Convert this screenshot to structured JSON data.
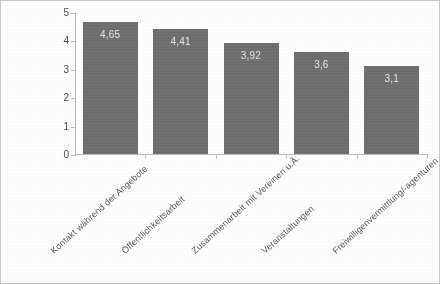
{
  "chart_data": {
    "type": "bar",
    "title": "",
    "subtitle": "",
    "xlabel": "",
    "ylabel": "",
    "ylim": [
      0,
      5
    ],
    "ytick_labels": [
      "5",
      "4",
      "3",
      "2",
      "1",
      "0"
    ],
    "ytick_values": [
      5,
      4,
      3,
      2,
      1,
      0
    ],
    "grid": false,
    "legend": false,
    "legend_position": "none",
    "bar_color": "#6d6d6d",
    "value_label_color": "#e9e9e9",
    "axis_color": "#b9b9b9",
    "categories": [
      "Kontakt während der Angebote",
      "Öffentlichkeitsarbeit",
      "Zusammenarbeit mit Vereinen u.Ä.",
      "Veranstaltungen",
      "Freiwilligenvermittlung/-agenturen"
    ],
    "values": [
      4.65,
      4.41,
      3.92,
      3.6,
      3.1
    ],
    "value_labels": [
      "4,65",
      "4,41",
      "3,92",
      "3,6",
      "3,1"
    ]
  }
}
